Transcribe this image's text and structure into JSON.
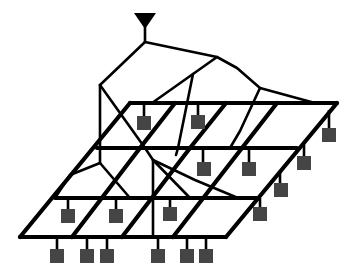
{
  "diagram": {
    "title": "",
    "colors": {
      "line": "#000000",
      "node": "#454545",
      "background": "#ffffff"
    },
    "root": {
      "type": "antenna-triangle",
      "x": 145,
      "y": 13
    },
    "grid": {
      "rows": 4,
      "row_y": [
        103,
        148,
        198,
        237
      ],
      "columns_per_row": 5
    },
    "node_count": 20,
    "labels": []
  }
}
